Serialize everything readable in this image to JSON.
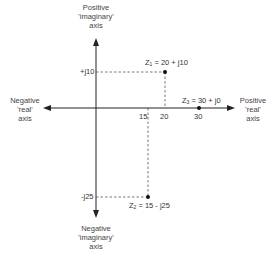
{
  "axes": {
    "positive_imaginary": {
      "line1": "Positive",
      "line2": "'imaginary'",
      "line3": "axis"
    },
    "negative_imaginary": {
      "line1": "Negative",
      "line2": "'imaginary'",
      "line3": "axis"
    },
    "positive_real": {
      "line1": "Positive",
      "line2": "'real'",
      "line3": "axis"
    },
    "negative_real": {
      "line1": "Negative",
      "line2": "'real'",
      "line3": "axis"
    }
  },
  "ticks": {
    "imag_pos": "+j10",
    "imag_neg": "-j25",
    "real_15": "15",
    "real_20": "20",
    "real_30": "30"
  },
  "points": [
    {
      "name": "Z",
      "sub": "1",
      "expr": " = 20 + j10",
      "re": 20,
      "im": 10
    },
    {
      "name": "Z",
      "sub": "2",
      "expr": " = 15 - j25",
      "re": 15,
      "im": -25
    },
    {
      "name": "Z",
      "sub": "3",
      "expr": " = 30 + j0",
      "re": 30,
      "im": 0
    }
  ],
  "colors": {
    "line": "#222222",
    "dash": "#555555",
    "point": "#111111"
  }
}
